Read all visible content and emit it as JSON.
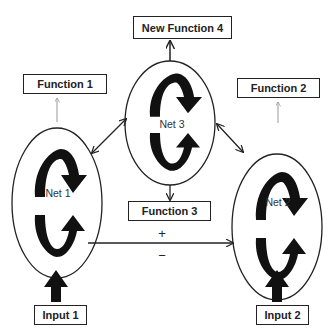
{
  "diagram": {
    "nets": [
      {
        "label": "Net 1"
      },
      {
        "label": "Net 2"
      },
      {
        "label": "Net 3"
      }
    ],
    "functions": [
      {
        "label": "Function 1"
      },
      {
        "label": "Function 2"
      },
      {
        "label": "Function 3"
      },
      {
        "label": "New Function 4"
      }
    ],
    "inputs": [
      {
        "label": "Input 1"
      },
      {
        "label": "Input 2"
      }
    ],
    "signs": {
      "plus": "+",
      "minus": "−"
    },
    "colors": {
      "stroke": "#222222",
      "faint_arrow": "#999999",
      "background": "#ffffff"
    }
  }
}
